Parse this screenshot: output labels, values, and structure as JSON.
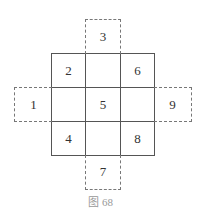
{
  "figure": {
    "caption": "图 68",
    "main_grid": {
      "rows": [
        [
          "2",
          "",
          "6"
        ],
        [
          "",
          "5",
          ""
        ],
        [
          "4",
          "",
          "8"
        ]
      ]
    },
    "outer_cells": {
      "top": "3",
      "left": "1",
      "right": "9",
      "bottom": "7"
    }
  }
}
